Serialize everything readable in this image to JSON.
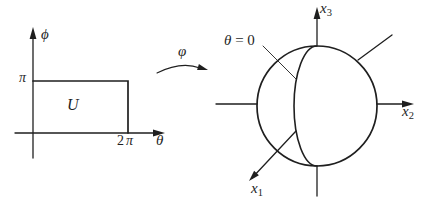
{
  "colors": {
    "ink": "#1f1f1f",
    "background": "#ffffff"
  },
  "domain_plot": {
    "axis_phi": "ϕ",
    "axis_theta": "θ",
    "tick_pi": "π",
    "tick_two_pi_coeff": "2",
    "tick_two_pi_symbol": "π",
    "region": "U"
  },
  "map_arrow": {
    "label": "φ"
  },
  "sphere_plot": {
    "meridian_var": "θ",
    "meridian_rest": " = 0",
    "x_var": "x",
    "x1_sub": "1",
    "x2_sub": "2",
    "x3_sub": "3"
  }
}
